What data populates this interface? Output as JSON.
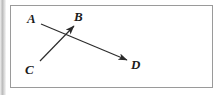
{
  "figure": {
    "name": "vector-diagram",
    "frame": {
      "border_color": "#9a9a9a",
      "background_color": "#ffffff"
    },
    "stroke_color": "#2b2b2b",
    "labels": [
      {
        "id": "A",
        "text": "A",
        "x": 33,
        "y": 19
      },
      {
        "id": "B",
        "text": "B",
        "x": 80,
        "y": 17
      },
      {
        "id": "C",
        "text": "C",
        "x": 30,
        "y": 70
      },
      {
        "id": "D",
        "text": "D",
        "x": 137,
        "y": 65
      }
    ],
    "arrows": [
      {
        "id": "C-to-B",
        "from": "C",
        "to": "B",
        "x1": 40,
        "y1": 61,
        "x2": 74,
        "y2": 26,
        "arrowhead_at": "B"
      },
      {
        "id": "A-to-D",
        "from": "A",
        "to": "D",
        "x1": 41,
        "y1": 24,
        "x2": 127,
        "y2": 60,
        "arrowhead_at": "D"
      }
    ]
  }
}
